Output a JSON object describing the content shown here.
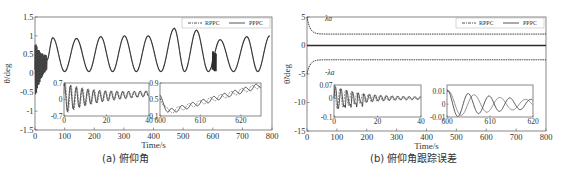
{
  "colors": {
    "line": "#2b2b2b",
    "axis": "#555555",
    "background": "#ffffff"
  },
  "captions": {
    "a": "(a) 俯仰角",
    "b": "(b) 俯仰角跟踪误差"
  },
  "chart_data": [
    {
      "id": "a",
      "type": "line",
      "title": "(a) 俯仰角",
      "xlabel": "Time/s",
      "ylabel": "θ/deg",
      "xlim": [
        0,
        800
      ],
      "ylim": [
        -1.5,
        1.5
      ],
      "xticks": [
        0,
        100,
        200,
        300,
        400,
        500,
        600,
        700,
        800
      ],
      "yticks": [
        -1.5,
        -1,
        -0.5,
        0,
        0.5,
        1,
        1.5
      ],
      "ytick_labels": [
        "-1.5",
        "-1",
        "-0.5",
        "0",
        "0.5",
        "1",
        "1.5"
      ],
      "legend": {
        "position": "upper right",
        "entries": [
          "RPPC",
          "PPPC"
        ]
      },
      "series": [
        {
          "name": "RPPC",
          "style": "dash-dot",
          "description": "Initial oscillation 0–40 s between about -0.7 and 0.7, then sinusoid oscillating between ~0.05 and ~1.0 with period ~80 s; peak ~1.2 near t=470; disturbance near t=600"
        },
        {
          "name": "PPPC",
          "style": "solid",
          "description": "Overlaps RPPC closely"
        }
      ],
      "peaks": [
        {
          "x": 60,
          "y": 0.95
        },
        {
          "x": 140,
          "y": 0.93
        },
        {
          "x": 222,
          "y": 0.98
        },
        {
          "x": 302,
          "y": 1.0
        },
        {
          "x": 382,
          "y": 1.0
        },
        {
          "x": 470,
          "y": 1.2
        },
        {
          "x": 545,
          "y": 1.15
        },
        {
          "x": 625,
          "y": 0.9
        },
        {
          "x": 715,
          "y": 0.98
        },
        {
          "x": 792,
          "y": 1.0
        }
      ],
      "troughs": [
        {
          "x": 100,
          "y": 0.05
        },
        {
          "x": 182,
          "y": 0.05
        },
        {
          "x": 262,
          "y": 0.05
        },
        {
          "x": 342,
          "y": 0.05
        },
        {
          "x": 425,
          "y": 0.05
        },
        {
          "x": 505,
          "y": 0.05
        },
        {
          "x": 585,
          "y": 0.05
        },
        {
          "x": 670,
          "y": 0.05
        },
        {
          "x": 752,
          "y": 0.05
        }
      ],
      "insets": [
        {
          "xlim": [
            0,
            40
          ],
          "ylim": [
            -0.7,
            0.7
          ],
          "xticks": [
            0,
            20,
            40
          ],
          "yticks": [
            -0.7,
            0,
            0.7
          ],
          "ytick_labels": [
            "-0.7",
            "0",
            "0.7"
          ],
          "description": "Decaying oscillation, amplitude ~0.7 at start, settling upward to ~0.3 by 40 s"
        },
        {
          "xlim": [
            600,
            625
          ],
          "ylim": [
            0.1,
            0.9
          ],
          "xticks": [
            600,
            610,
            620
          ],
          "yticks": [
            0.1,
            0.5,
            0.9
          ],
          "ytick_labels": [
            "0.1",
            "0.5",
            "0.9"
          ],
          "description": "Drop from 0.55 to ~0.2 near 602 s, then rising ripple to ~0.85 at 625 s"
        }
      ]
    },
    {
      "id": "b",
      "type": "line",
      "title": "(b) 俯仰角跟踪误差",
      "xlabel": "Time/s",
      "ylabel": "θ̃/deg",
      "xlim": [
        0,
        800
      ],
      "ylim": [
        -15,
        5
      ],
      "xticks": [
        0,
        100,
        200,
        300,
        400,
        500,
        600,
        700,
        800
      ],
      "yticks": [
        -15,
        -10,
        -5,
        0,
        5
      ],
      "ytick_labels": [
        "-15",
        "-10",
        "-5",
        "0",
        "5"
      ],
      "legend": {
        "position": "upper right",
        "entries": [
          "RPPC",
          "PPPC"
        ]
      },
      "annotations": [
        {
          "text": "λa",
          "x": 60,
          "y": 4.3
        },
        {
          "text": "-λa",
          "x": 60,
          "y": -5.2
        }
      ],
      "series": [
        {
          "name": "RPPC",
          "style": "dash-dot",
          "description": "Tracking error near 0 throughout"
        },
        {
          "name": "PPPC",
          "style": "solid",
          "description": "Tracking error near 0 throughout"
        },
        {
          "name": "upper bound λa",
          "style": "dotted",
          "description": "Decays from 5 to ~2 by t≈40 s, then constant ~2"
        },
        {
          "name": "lower bound -λa",
          "style": "dotted",
          "description": "Rises from -5 to ~-2.5 by t≈40 s, then constant ~-2.5"
        }
      ],
      "insets": [
        {
          "xlim": [
            0,
            40
          ],
          "ylim": [
            -0.1,
            0.07
          ],
          "xticks": [
            0,
            20,
            40
          ],
          "yticks": [
            -0.1,
            0,
            0.07
          ],
          "ytick_labels": [
            "-0.1",
            "0",
            "0.07"
          ],
          "description": "Spiky decaying error, peaks to 0.07 and dips to -0.1 near 10 s, settling to ~0 by 40 s"
        },
        {
          "xlim": [
            600,
            620
          ],
          "ylim": [
            -0.01,
            0.015
          ],
          "xticks": [
            600,
            610,
            620
          ],
          "yticks": [
            -0.01,
            0,
            0.01
          ],
          "ytick_labels": [
            "-0.01",
            "0",
            "0.01"
          ],
          "description": "Two out-of-phase decaying oscillations with amplitude ~0.012 at 600 s shrinking to ~0.004 at 620 s"
        }
      ]
    }
  ]
}
